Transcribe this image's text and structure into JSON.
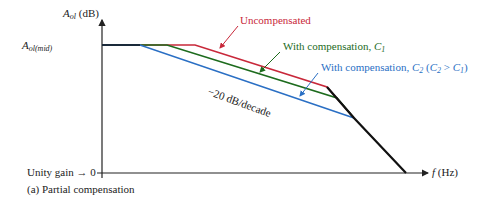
{
  "axes": {
    "y_label_main": "A",
    "y_label_sub": "ol",
    "y_label_unit": " (dB)",
    "y_mid_main": "A",
    "y_mid_sub": "ol(mid)",
    "x_label_var": "f",
    "x_label_unit": " (Hz)",
    "unity_gain": "Unity gain → 0"
  },
  "curves": [
    {
      "name": "Uncompensated",
      "color": "#c8283a"
    },
    {
      "name": "With compensation, C1",
      "color": "#1d6b1d"
    },
    {
      "name": "With compensation, C2 (C2 > C1)",
      "color": "#2a6fc4"
    }
  ],
  "labels": {
    "uncompensated": "Uncompensated",
    "c1_prefix": "With compensation, ",
    "c1_var": "C",
    "c1_sub": "1",
    "c2_prefix": "With compensation, ",
    "c2_var": "C",
    "c2_sub": "2",
    "c2_paren_open": " (",
    "c2_cmp_var1": "C",
    "c2_cmp_sub1": "2",
    "c2_cmp_op": " > ",
    "c2_cmp_var2": "C",
    "c2_cmp_sub2": "1",
    "c2_paren_close": ")",
    "slope": "−20 dB/decade"
  },
  "caption": "(a) Partial compensation",
  "colors": {
    "uncompensated": "#c8283a",
    "c1": "#1d6b1d",
    "c2": "#2a6fc4",
    "axis": "#222222",
    "final_rolloff": "#111111"
  }
}
